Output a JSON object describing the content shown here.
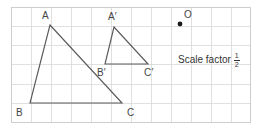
{
  "figure": {
    "title_text": "",
    "background_color": "#ffffff",
    "grid": {
      "line_color": "#d8d8d8",
      "border_color": "#cccccc",
      "cell_size": 20,
      "left": 11,
      "top": 7,
      "right": 250,
      "bottom": 122,
      "columns": 12,
      "rows": 6
    },
    "stroke_color": "#5a5a5a",
    "label_color": "#444444",
    "shapes": [
      {
        "name": "triangle-abc",
        "kind": "triangle",
        "points": "50,25 30,103 122,103",
        "vertices": [
          {
            "label": "A",
            "x": 50,
            "y": 25,
            "label_x": 42,
            "label_y": 11
          },
          {
            "label": "B",
            "x": 30,
            "y": 103,
            "label_x": 16,
            "label_y": 108
          },
          {
            "label": "C",
            "x": 122,
            "y": 103,
            "label_x": 127,
            "label_y": 108
          }
        ]
      },
      {
        "name": "triangle-a-prime-b-prime-c-prime",
        "kind": "triangle",
        "points": "114,27 105,64 148,64",
        "vertices": [
          {
            "label": "A′",
            "x": 114,
            "y": 27,
            "label_x": 108,
            "label_y": 12
          },
          {
            "label": "B′",
            "x": 105,
            "y": 64,
            "label_x": 97,
            "label_y": 68
          },
          {
            "label": "C′",
            "x": 148,
            "y": 64,
            "label_x": 144,
            "label_y": 68
          }
        ]
      }
    ],
    "centre_of_enlargement": {
      "label": "O",
      "x": 180,
      "y": 24,
      "radius": 2.4,
      "dot_color": "#1a1a1a",
      "label_x": 184,
      "label_y": 10
    },
    "annotation": {
      "name": "scale-factor-note",
      "text": "Scale factor",
      "fraction_numerator": "1",
      "fraction_denominator": "2",
      "full_text": "Scale factor 1/2"
    }
  }
}
